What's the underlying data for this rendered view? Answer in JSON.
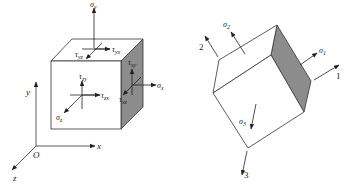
{
  "left_diagram": {
    "title": "General stress state on cube element",
    "axes": {
      "origin": "O",
      "x": "x",
      "y": "y",
      "z": "z"
    },
    "stresses": {
      "sigma_y": {
        "symbol": "σ",
        "sub": "y"
      },
      "tau_yx": {
        "symbol": "τ",
        "sub": "yx"
      },
      "tau_yz": {
        "symbol": "τ",
        "sub": "yz"
      },
      "tau_zy": {
        "symbol": "τ",
        "sub": "zy"
      },
      "tau_zx": {
        "symbol": "τ",
        "sub": "zx"
      },
      "sigma_z": {
        "symbol": "σ",
        "sub": "z"
      },
      "tau_xy": {
        "symbol": "τ",
        "sub": "xy"
      },
      "tau_xz": {
        "symbol": "τ",
        "sub": "xz"
      },
      "sigma_x": {
        "symbol": "σ",
        "sub": "x"
      }
    },
    "colors": {
      "line": "#333333",
      "shaded_face": "#8c8c8c"
    }
  },
  "right_diagram": {
    "title": "Principal stress state",
    "axes": {
      "axis1": "1",
      "axis2": "2",
      "axis3": "3"
    },
    "stresses": {
      "sigma_1": {
        "symbol": "σ",
        "sub": "1"
      },
      "sigma_2": {
        "symbol": "σ",
        "sub": "2"
      },
      "sigma_3": {
        "symbol": "σ",
        "sub": "3"
      }
    },
    "colors": {
      "line": "#333333",
      "shaded_face": "#8c8c8c"
    }
  }
}
